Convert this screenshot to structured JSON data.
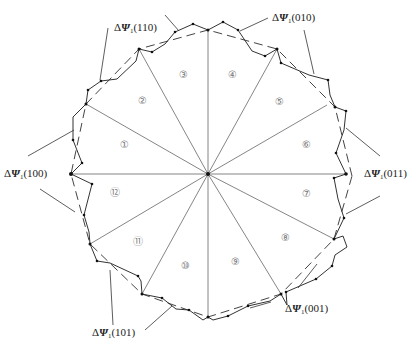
{
  "figure": {
    "type": "flux-linkage sector diagram",
    "sector_count": 12,
    "sectors": [
      "①",
      "②",
      "③",
      "④",
      "⑤",
      "⑥",
      "⑦",
      "⑧",
      "⑨",
      "⑩",
      "⑪",
      "⑫"
    ],
    "vector_labels": [
      {
        "id": "110",
        "delta": "Δ",
        "symbol": "Ψ",
        "sub": "1",
        "code": "(110)"
      },
      {
        "id": "010",
        "delta": "Δ",
        "symbol": "Ψ",
        "sub": "1",
        "code": "(010)"
      },
      {
        "id": "100",
        "delta": "Δ",
        "symbol": "Ψ",
        "sub": "1",
        "code": "(100)"
      },
      {
        "id": "011",
        "delta": "Δ",
        "symbol": "Ψ",
        "sub": "1",
        "code": "(011)"
      },
      {
        "id": "101",
        "delta": "Δ",
        "symbol": "Ψ",
        "sub": "1",
        "code": "(101)"
      },
      {
        "id": "001",
        "delta": "Δ",
        "symbol": "Ψ",
        "sub": "1",
        "code": "(001)"
      }
    ],
    "colors": {
      "spokes": "#777777",
      "trajectory": "#333333",
      "dashed_polygon": "#444444",
      "label": "#222222",
      "sector_number": "#777777"
    }
  }
}
